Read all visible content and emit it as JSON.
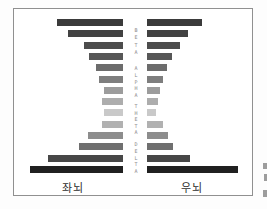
{
  "chart_data": {
    "type": "bar",
    "orientation": "horizontal-bidirectional",
    "title": "",
    "xlabel": "",
    "ylabel": "",
    "grid": false,
    "legend_position": "none",
    "units": "relative bar length (px, no numeric axis shown)",
    "rows": 14,
    "band_labels": [
      "BETA",
      "ALPHA",
      "THETA",
      "DELTA"
    ],
    "series": [
      {
        "name": "좌뇌",
        "side": "left",
        "values": [
          66,
          55,
          39,
          34,
          27,
          24,
          19,
          21,
          19,
          21,
          35,
          44,
          75,
          93
        ]
      },
      {
        "name": "우뇌",
        "side": "right",
        "values": [
          55,
          41,
          33,
          25,
          20,
          16,
          13,
          11,
          9,
          16,
          21,
          26,
          43,
          91
        ]
      }
    ],
    "row_colors": [
      "#3b3b3b",
      "#424242",
      "#4d4d4d",
      "#575757",
      "#6c6c6c",
      "#7e7e7e",
      "#9c9c9c",
      "#adadad",
      "#c9c9c9",
      "#b1b1b1",
      "#8d8d8d",
      "#6f6f6f",
      "#474747",
      "#202020"
    ]
  },
  "axis": {
    "left_label": "좌뇌",
    "right_label": "우뇌"
  },
  "colors": {
    "frame_border": "#909090",
    "background": "#ffffff",
    "band_letter_text": "#8a8a8a",
    "axis_label_text": "#2e2e2e",
    "bar_darkest": "#202020",
    "bar_lightest": "#c9c9c9"
  },
  "artifacts": {
    "right_edge_cropped_marks_count": 3
  }
}
